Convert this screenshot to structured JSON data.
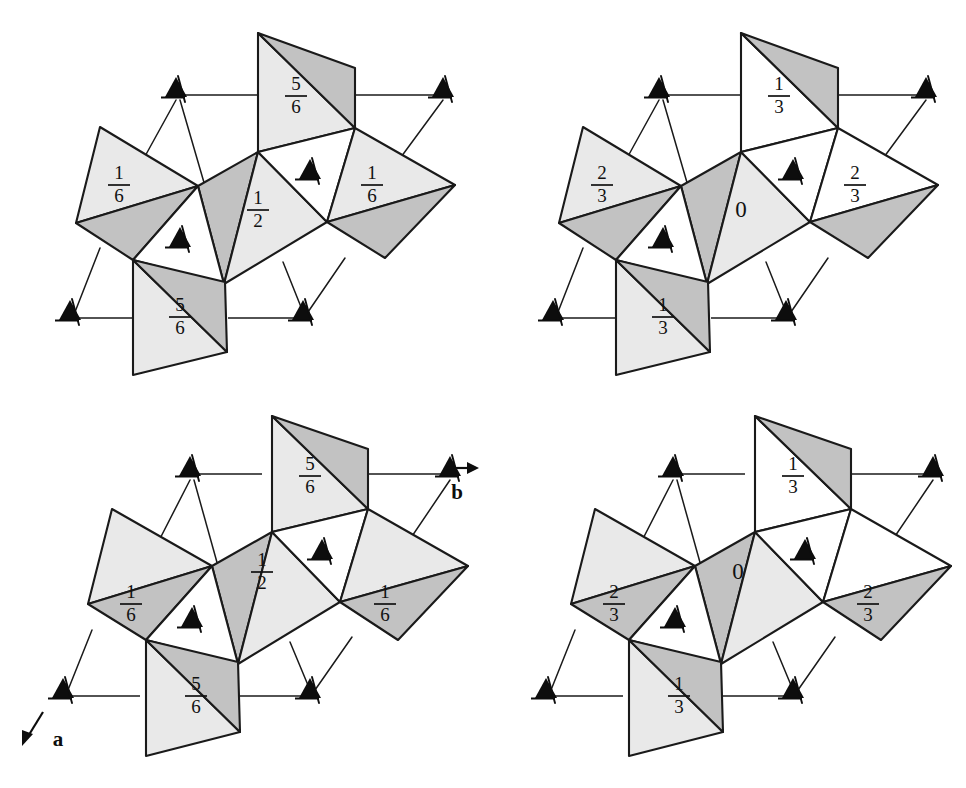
{
  "figure": {
    "kind": "crystal-structure-projection",
    "background_color": "#ffffff",
    "line_color": "#1a1a1a",
    "fill_light": "#e9e9e9",
    "fill_dark": "#c2c2c2",
    "fill_white": "#ffffff",
    "width": 966,
    "height": 788
  },
  "axes": {
    "a": {
      "label": "a",
      "direction": "down-left"
    },
    "b": {
      "label": "b",
      "direction": "right"
    }
  },
  "panels": [
    {
      "id": "top-left",
      "position": "top-left",
      "labels": [
        {
          "name": "top-tetrahedron",
          "value": "5/6",
          "numerator": "5",
          "denominator": "6"
        },
        {
          "name": "left-tetrahedron",
          "value": "1/6",
          "numerator": "1",
          "denominator": "6"
        },
        {
          "name": "center-tetrahedron",
          "value": "1/2",
          "numerator": "1",
          "denominator": "2"
        },
        {
          "name": "right-tetrahedron",
          "value": "1/6",
          "numerator": "1",
          "denominator": "6"
        },
        {
          "name": "bottom-tetrahedron",
          "value": "5/6",
          "numerator": "5",
          "denominator": "6"
        }
      ],
      "triad_count": 6
    },
    {
      "id": "top-right",
      "position": "top-right",
      "labels": [
        {
          "name": "top-tetrahedron",
          "value": "1/3",
          "numerator": "1",
          "denominator": "3"
        },
        {
          "name": "left-tetrahedron",
          "value": "2/3",
          "numerator": "2",
          "denominator": "3"
        },
        {
          "name": "center-tetrahedron",
          "value": "0",
          "numerator": "",
          "denominator": ""
        },
        {
          "name": "right-tetrahedron",
          "value": "2/3",
          "numerator": "2",
          "denominator": "3"
        },
        {
          "name": "bottom-tetrahedron",
          "value": "1/3",
          "numerator": "1",
          "denominator": "3"
        }
      ],
      "triad_count": 6
    },
    {
      "id": "bottom-left",
      "position": "bottom-left",
      "labels": [
        {
          "name": "top-tetrahedron",
          "value": "5/6",
          "numerator": "5",
          "denominator": "6"
        },
        {
          "name": "left-tetrahedron",
          "value": "1/6",
          "numerator": "1",
          "denominator": "6"
        },
        {
          "name": "center-tetrahedron",
          "value": "1/2",
          "numerator": "1",
          "denominator": "2"
        },
        {
          "name": "right-tetrahedron",
          "value": "1/6",
          "numerator": "1",
          "denominator": "6"
        },
        {
          "name": "bottom-tetrahedron",
          "value": "5/6",
          "numerator": "5",
          "denominator": "6"
        }
      ],
      "triad_count": 6
    },
    {
      "id": "bottom-right",
      "position": "bottom-right",
      "labels": [
        {
          "name": "top-tetrahedron",
          "value": "1/3",
          "numerator": "1",
          "denominator": "3"
        },
        {
          "name": "left-tetrahedron",
          "value": "2/3",
          "numerator": "2",
          "denominator": "3"
        },
        {
          "name": "center-tetrahedron",
          "value": "0",
          "numerator": "",
          "denominator": ""
        },
        {
          "name": "right-tetrahedron",
          "value": "2/3",
          "numerator": "2",
          "denominator": "3"
        },
        {
          "name": "bottom-tetrahedron",
          "value": "1/3",
          "numerator": "1",
          "denominator": "3"
        }
      ],
      "triad_count": 6
    }
  ]
}
